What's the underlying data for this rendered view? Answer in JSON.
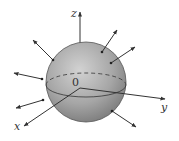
{
  "diagram": {
    "axes": {
      "x_label": "x",
      "y_label": "y",
      "z_label": "z",
      "origin_label": "0"
    },
    "sphere": {
      "center": [
        86,
        82
      ],
      "radius": 40,
      "fill_light": "#cfcfcf",
      "fill_dark": "#7d7d7d",
      "stroke": "#444444"
    },
    "normal_vectors": [
      {
        "from": [
          53,
          60
        ],
        "to": [
          33,
          40
        ]
      },
      {
        "from": [
          42,
          79
        ],
        "to": [
          14,
          73
        ]
      },
      {
        "from": [
          43,
          100
        ],
        "to": [
          16,
          108
        ]
      },
      {
        "from": [
          102,
          52
        ],
        "to": [
          117,
          30
        ]
      },
      {
        "from": [
          111,
          63
        ],
        "to": [
          135,
          47
        ]
      },
      {
        "from": [
          112,
          111
        ],
        "to": [
          136,
          127
        ]
      }
    ],
    "colors": {
      "axis": "#333333",
      "arrow": "#333333"
    }
  }
}
